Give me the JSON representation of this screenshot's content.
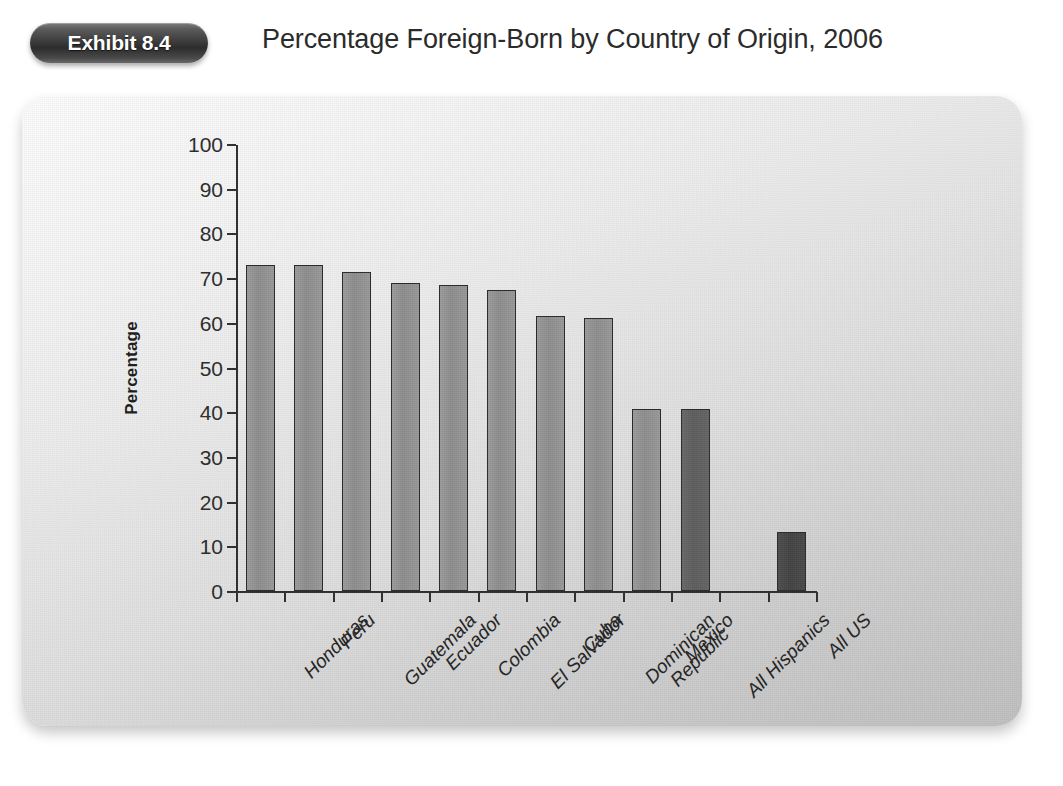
{
  "header": {
    "exhibit_badge": "Exhibit 8.4",
    "title": "Percentage Foreign-Born by Country of Origin, 2006"
  },
  "chart_data": {
    "type": "bar",
    "title": "Percentage Foreign-Born by Country of Origin, 2006",
    "xlabel": "",
    "ylabel": "Percentage",
    "ylim": [
      0,
      100
    ],
    "ytick_step": 10,
    "yticks": [
      0,
      10,
      20,
      30,
      40,
      50,
      60,
      70,
      80,
      90,
      100
    ],
    "grid": false,
    "legend": "none",
    "categories": [
      "Honduras",
      "Peru",
      "Guatemala",
      "Ecuador",
      "Colombia",
      "El Salvador",
      "Cuba",
      "Dominican\nRepublic",
      "Mexico",
      "All Hispanics",
      "All US"
    ],
    "values": [
      73.0,
      73.0,
      71.3,
      69.0,
      68.5,
      67.4,
      61.6,
      61.0,
      40.8,
      40.7,
      13.2
    ],
    "bar_styles": [
      "normal",
      "normal",
      "normal",
      "normal",
      "normal",
      "normal",
      "normal",
      "normal",
      "normal",
      "hispanic",
      "us"
    ]
  },
  "colors": {
    "bar_normal": "#909090",
    "bar_hispanic": "#606060",
    "bar_all_us": "#464646",
    "bar_outline": "#2a2a2a",
    "axis": "#2e2e2e",
    "badge_dark": "#2c2c2c",
    "panel_light": "#fbfbfb",
    "panel_dark": "#bfbfbf",
    "text": "#2b2b2b"
  }
}
